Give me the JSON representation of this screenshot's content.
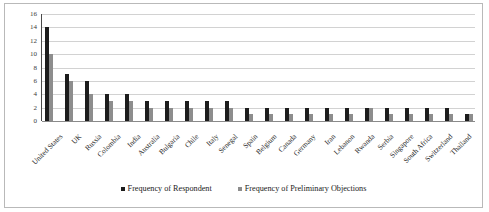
{
  "chart_data": {
    "type": "bar",
    "title": "",
    "xlabel": "",
    "ylabel": "",
    "ylim": [
      0,
      16
    ],
    "yticks": [
      0,
      2,
      4,
      6,
      8,
      10,
      12,
      14,
      16
    ],
    "grid": true,
    "legend_position": "bottom",
    "categories": [
      "United States",
      "UK",
      "Russia",
      "Colombia",
      "India",
      "Australia",
      "Bulgaria",
      "Chile",
      "Italy",
      "Senegal",
      "Spain",
      "Belgium",
      "Canada",
      "Germany",
      "Iran",
      "Lebanon",
      "Rwanda",
      "Serbia",
      "Singapore",
      "South Africa",
      "Switzerland",
      "Thailand"
    ],
    "series": [
      {
        "name": "Frequency of Respondent",
        "color": "#1c1c1c",
        "values": [
          14,
          7,
          6,
          4,
          4,
          3,
          3,
          3,
          3,
          3,
          2,
          2,
          2,
          2,
          2,
          2,
          2,
          2,
          2,
          2,
          2,
          1
        ]
      },
      {
        "name": "Frequency of Preliminary Objections",
        "color": "#8d8d8d",
        "values": [
          10,
          6,
          4,
          3,
          3,
          2,
          2,
          2,
          2,
          2,
          1,
          1,
          1,
          1,
          1,
          1,
          2,
          1,
          1,
          1,
          1,
          1
        ]
      }
    ]
  },
  "legend": {
    "items": [
      {
        "label": "Frequency of Respondent"
      },
      {
        "label": "Frequency of Preliminary Objections"
      }
    ]
  }
}
